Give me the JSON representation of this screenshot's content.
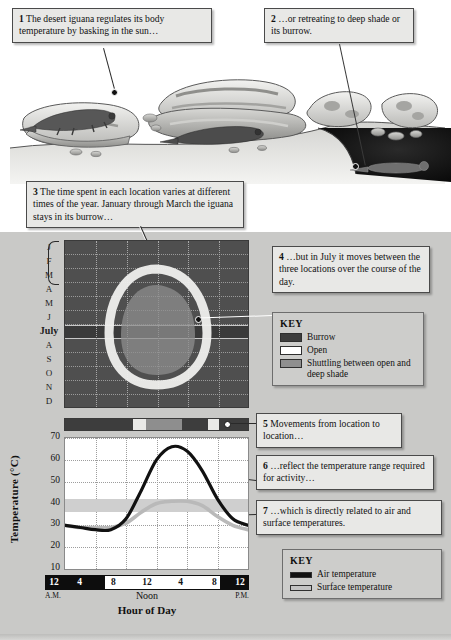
{
  "callouts": [
    {
      "id": "1",
      "num": "1",
      "text": "The desert iguana regulates its body temperature by basking in the sun…"
    },
    {
      "id": "2",
      "num": "2",
      "text": "…or retreating to deep shade or its burrow."
    },
    {
      "id": "3",
      "num": "3",
      "text": "The time spent in each location varies at different times of the year. January through March the iguana stays in its burrow…"
    },
    {
      "id": "4",
      "num": "4",
      "text": "…but in July it moves between the three locations over the course of the day."
    },
    {
      "id": "5",
      "num": "5",
      "text": "Movements from location to location…"
    },
    {
      "id": "6",
      "num": "6",
      "text": "…reflect the temperature range required for activity…"
    },
    {
      "id": "7",
      "num": "7",
      "text": "…which is directly related to air and surface temperatures."
    }
  ],
  "location_key": {
    "title": "KEY",
    "items": [
      {
        "label": "Burrow",
        "color": "#3d3d3d"
      },
      {
        "label": "Open",
        "color": "#ffffff"
      },
      {
        "label": "Shuttling between open and deep shade",
        "color": "#8f8f8f"
      }
    ]
  },
  "temperature_key": {
    "title": "KEY",
    "items": [
      {
        "label": "Air temperature",
        "color": "#111111"
      },
      {
        "label": "Surface temperature",
        "color": "#b9b9b9"
      }
    ]
  },
  "chart_data": [
    {
      "type": "heatmap",
      "name": "location-by-month",
      "title": "",
      "ylabel": "",
      "xlabel": "",
      "categories": [
        "J",
        "F",
        "M",
        "A",
        "M",
        "J",
        "July",
        "A",
        "S",
        "O",
        "N",
        "D"
      ],
      "x": [
        "12",
        "4",
        "8",
        "12",
        "4",
        "8",
        "12"
      ],
      "grid": true,
      "background_label": "Burrow",
      "regions": [
        {
          "label": "Open",
          "color": "#efefed",
          "months": [
            "A",
            "M",
            "J",
            "July",
            "A",
            "S",
            "O"
          ],
          "note": "white ring spanning mid-day hours, widest in July"
        },
        {
          "label": "Shuttling between open and deep shade",
          "color": "#8e8e8e",
          "months": [
            "M",
            "J",
            "July",
            "A",
            "S"
          ],
          "note": "inner gray region centred on midday"
        }
      ]
    },
    {
      "type": "bar",
      "name": "daily-location-strip",
      "title": "",
      "categories": [
        "12 A.M.",
        "4",
        "8",
        "12 Noon",
        "4",
        "8",
        "12 P.M."
      ],
      "segments": [
        {
          "label": "Burrow",
          "color": "#3d3d3d",
          "start": 0,
          "end": 37
        },
        {
          "label": "Open",
          "color": "#e9e9e7",
          "start": 37,
          "end": 44
        },
        {
          "label": "Shuttling between open and deep shade",
          "color": "#8e8e8e",
          "start": 44,
          "end": 64
        },
        {
          "label": "Burrow",
          "color": "#3d3d3d",
          "start": 64,
          "end": 78
        },
        {
          "label": "Open",
          "color": "#e9e9e7",
          "start": 78,
          "end": 84
        },
        {
          "label": "Burrow",
          "color": "#3d3d3d",
          "start": 84,
          "end": 100
        }
      ]
    },
    {
      "type": "line",
      "title": "",
      "xlabel": "Hour of Day",
      "ylabel": "Temperature (°C)",
      "ylim": [
        10,
        70
      ],
      "yticks": [
        70,
        60,
        50,
        40,
        30,
        20,
        10
      ],
      "x": [
        0,
        2,
        4,
        6,
        8,
        10,
        12,
        14,
        16,
        18,
        20,
        22,
        24
      ],
      "xticklabels": [
        "12",
        "4",
        "8",
        "12",
        "4",
        "8",
        "12"
      ],
      "xtick_sublabels": [
        "A.M.",
        "Noon",
        "P.M."
      ],
      "grid": true,
      "activity_band": [
        36,
        42
      ],
      "series": [
        {
          "name": "Air temperature",
          "color": "#111111",
          "values": [
            30,
            29,
            28,
            28,
            33,
            46,
            60,
            66,
            64,
            55,
            42,
            33,
            30
          ]
        },
        {
          "name": "Surface temperature",
          "color": "#b9b9b9",
          "values": [
            30,
            29,
            29,
            29,
            31,
            36,
            40,
            41,
            41,
            39,
            34,
            30,
            28
          ]
        }
      ]
    }
  ]
}
